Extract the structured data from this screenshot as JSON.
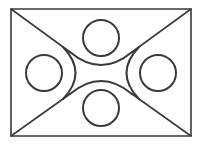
{
  "diagram": {
    "title": "",
    "background": "#ffffff",
    "stroke_color": "#3a3a3a",
    "frame": {
      "x": 11,
      "y": 9,
      "width": 180,
      "height": 127,
      "stroke_width": 1.6
    },
    "diagonals": [
      {
        "name": "diagonal-top-left",
        "x1": 11,
        "y1": 9,
        "x2": 70,
        "y2": 52
      },
      {
        "name": "diagonal-top-right",
        "x1": 191,
        "y1": 9,
        "x2": 132,
        "y2": 52
      },
      {
        "name": "diagonal-bottom-left",
        "x1": 11,
        "y1": 136,
        "x2": 70,
        "y2": 94
      },
      {
        "name": "diagonal-bottom-right",
        "x1": 191,
        "y1": 136,
        "x2": 132,
        "y2": 94
      }
    ],
    "arcs": [
      {
        "name": "arc-top",
        "d": "M 70 52 Q 101 78 132 52"
      },
      {
        "name": "arc-bottom",
        "d": "M 70 94 Q 101 68 132 94"
      },
      {
        "name": "arc-left",
        "d": "M 63 47 Q 88 73 63 99"
      },
      {
        "name": "arc-right",
        "d": "M 139 47 Q 114 73 139 99"
      }
    ],
    "circles": [
      {
        "name": "circle-top",
        "cx": 101,
        "cy": 38,
        "r": 18
      },
      {
        "name": "circle-left",
        "cx": 44,
        "cy": 73,
        "r": 18
      },
      {
        "name": "circle-right",
        "cx": 158,
        "cy": 73,
        "r": 18
      },
      {
        "name": "circle-bottom",
        "cx": 101,
        "cy": 108,
        "r": 18
      }
    ],
    "stroke_width": 2
  }
}
